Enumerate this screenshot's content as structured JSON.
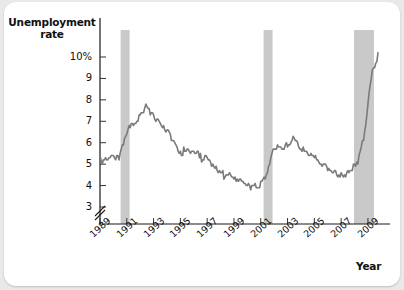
{
  "figure": {
    "y_axis_title_line1": "Unemployment",
    "y_axis_title_line2": "rate",
    "x_axis_title": "Year",
    "background_color": "#ffffff",
    "page_color": "#e9e9e9",
    "line_color": "#7a7a7a",
    "recession_band_color": "#c9c9c9",
    "axis_color": "#1a1a1a"
  },
  "chart_data": {
    "type": "line",
    "title": "",
    "subtitle": "",
    "xlabel": "Year",
    "ylabel": "Unemployment rate",
    "grid": false,
    "legend": "none",
    "y_axis_break": true,
    "ylim": [
      2.6,
      11.0
    ],
    "xlim": [
      1989.0,
      2009.9
    ],
    "ytick_labels": [
      "10%",
      "9",
      "8",
      "7",
      "6",
      "5",
      "4",
      "3"
    ],
    "yticks": [
      10,
      9,
      8,
      7,
      6,
      5,
      4,
      3
    ],
    "xtick_labels": [
      "1989",
      "1991",
      "1993",
      "1995",
      "1997",
      "1999",
      "2001",
      "2003",
      "2005",
      "2007",
      "2009"
    ],
    "xticks": [
      1989,
      1991,
      1993,
      1995,
      1997,
      1999,
      2001,
      2003,
      2005,
      2007,
      2009
    ],
    "annotations": [
      {
        "label": "recession-band-1990",
        "x_start": 1990.54,
        "x_end": 1991.21
      },
      {
        "label": "recession-band-2001",
        "x_start": 2001.21,
        "x_end": 2001.88
      },
      {
        "label": "recession-band-2007",
        "x_start": 2007.96,
        "x_end": 2009.45
      }
    ],
    "series": [
      {
        "name": "Unemployment rate",
        "color": "#7a7a7a",
        "x": [
          1989.0,
          1989.08,
          1989.17,
          1989.25,
          1989.33,
          1989.42,
          1989.5,
          1989.58,
          1989.67,
          1989.75,
          1989.83,
          1989.92,
          1990.0,
          1990.08,
          1990.17,
          1990.25,
          1990.33,
          1990.42,
          1990.5,
          1990.58,
          1990.67,
          1990.75,
          1990.83,
          1990.92,
          1991.0,
          1991.08,
          1991.17,
          1991.25,
          1991.33,
          1991.42,
          1991.5,
          1991.58,
          1991.67,
          1991.75,
          1991.83,
          1991.92,
          1992.0,
          1992.08,
          1992.17,
          1992.25,
          1992.33,
          1992.42,
          1992.5,
          1992.58,
          1992.67,
          1992.75,
          1992.83,
          1992.92,
          1993.0,
          1993.08,
          1993.17,
          1993.25,
          1993.33,
          1993.42,
          1993.5,
          1993.58,
          1993.67,
          1993.75,
          1993.83,
          1993.92,
          1994.0,
          1994.08,
          1994.17,
          1994.25,
          1994.33,
          1994.42,
          1994.5,
          1994.58,
          1994.67,
          1994.75,
          1994.83,
          1994.92,
          1995.0,
          1995.08,
          1995.17,
          1995.25,
          1995.33,
          1995.42,
          1995.5,
          1995.58,
          1995.67,
          1995.75,
          1995.83,
          1995.92,
          1996.0,
          1996.08,
          1996.17,
          1996.25,
          1996.33,
          1996.42,
          1996.5,
          1996.58,
          1996.67,
          1996.75,
          1996.83,
          1996.92,
          1997.0,
          1997.08,
          1997.17,
          1997.25,
          1997.33,
          1997.42,
          1997.5,
          1997.58,
          1997.67,
          1997.75,
          1997.83,
          1997.92,
          1998.0,
          1998.08,
          1998.17,
          1998.25,
          1998.33,
          1998.42,
          1998.5,
          1998.58,
          1998.67,
          1998.75,
          1998.83,
          1998.92,
          1999.0,
          1999.08,
          1999.17,
          1999.25,
          1999.33,
          1999.42,
          1999.5,
          1999.58,
          1999.67,
          1999.75,
          1999.83,
          1999.92,
          2000.0,
          2000.08,
          2000.17,
          2000.25,
          2000.33,
          2000.42,
          2000.5,
          2000.58,
          2000.67,
          2000.75,
          2000.83,
          2000.92,
          2001.0,
          2001.08,
          2001.17,
          2001.25,
          2001.33,
          2001.42,
          2001.5,
          2001.58,
          2001.67,
          2001.75,
          2001.83,
          2001.92,
          2002.0,
          2002.08,
          2002.17,
          2002.25,
          2002.33,
          2002.42,
          2002.5,
          2002.58,
          2002.67,
          2002.75,
          2002.83,
          2002.92,
          2003.0,
          2003.08,
          2003.17,
          2003.25,
          2003.33,
          2003.42,
          2003.5,
          2003.58,
          2003.67,
          2003.75,
          2003.83,
          2003.92,
          2004.0,
          2004.08,
          2004.17,
          2004.25,
          2004.33,
          2004.42,
          2004.5,
          2004.58,
          2004.67,
          2004.75,
          2004.83,
          2004.92,
          2005.0,
          2005.08,
          2005.17,
          2005.25,
          2005.33,
          2005.42,
          2005.5,
          2005.58,
          2005.67,
          2005.75,
          2005.83,
          2005.92,
          2006.0,
          2006.08,
          2006.17,
          2006.25,
          2006.33,
          2006.42,
          2006.5,
          2006.58,
          2006.67,
          2006.75,
          2006.83,
          2006.92,
          2007.0,
          2007.08,
          2007.17,
          2007.25,
          2007.33,
          2007.42,
          2007.5,
          2007.58,
          2007.67,
          2007.75,
          2007.83,
          2007.92,
          2008.0,
          2008.08,
          2008.17,
          2008.25,
          2008.33,
          2008.42,
          2008.5,
          2008.58,
          2008.67,
          2008.75,
          2008.83,
          2008.92,
          2009.0,
          2009.08,
          2009.17,
          2009.25,
          2009.33,
          2009.42,
          2009.5,
          2009.58,
          2009.67,
          2009.75
        ],
        "y": [
          5.4,
          5.2,
          5.0,
          5.2,
          5.2,
          5.3,
          5.2,
          5.2,
          5.3,
          5.3,
          5.4,
          5.4,
          5.4,
          5.3,
          5.2,
          5.4,
          5.4,
          5.2,
          5.5,
          5.7,
          5.9,
          5.9,
          6.2,
          6.3,
          6.4,
          6.6,
          6.8,
          6.7,
          6.9,
          6.9,
          6.8,
          6.9,
          6.9,
          7.0,
          7.0,
          7.3,
          7.3,
          7.4,
          7.4,
          7.4,
          7.6,
          7.8,
          7.7,
          7.6,
          7.6,
          7.3,
          7.4,
          7.4,
          7.3,
          7.1,
          7.0,
          7.1,
          7.1,
          7.0,
          6.9,
          6.8,
          6.7,
          6.8,
          6.6,
          6.5,
          6.6,
          6.6,
          6.5,
          6.4,
          6.1,
          6.1,
          6.1,
          6.0,
          5.9,
          5.8,
          5.6,
          5.5,
          5.6,
          5.4,
          5.4,
          5.8,
          5.6,
          5.6,
          5.7,
          5.7,
          5.6,
          5.5,
          5.6,
          5.6,
          5.6,
          5.5,
          5.5,
          5.6,
          5.6,
          5.3,
          5.5,
          5.1,
          5.2,
          5.2,
          5.4,
          5.4,
          5.3,
          5.2,
          5.2,
          5.1,
          4.9,
          5.0,
          4.9,
          4.8,
          4.9,
          4.7,
          4.6,
          4.7,
          4.6,
          4.6,
          4.7,
          4.3,
          4.4,
          4.5,
          4.5,
          4.5,
          4.6,
          4.5,
          4.4,
          4.4,
          4.3,
          4.4,
          4.2,
          4.3,
          4.2,
          4.3,
          4.3,
          4.2,
          4.2,
          4.1,
          4.1,
          4.0,
          4.0,
          4.1,
          4.0,
          3.8,
          4.0,
          4.0,
          4.0,
          4.1,
          3.9,
          3.9,
          3.9,
          3.9,
          4.2,
          4.2,
          4.3,
          4.4,
          4.3,
          4.5,
          4.6,
          4.9,
          5.0,
          5.3,
          5.5,
          5.7,
          5.7,
          5.7,
          5.7,
          5.9,
          5.8,
          5.8,
          5.8,
          5.7,
          5.7,
          5.7,
          5.9,
          6.0,
          5.8,
          5.9,
          5.9,
          6.0,
          6.1,
          6.3,
          6.2,
          6.1,
          6.1,
          6.0,
          5.8,
          5.7,
          5.7,
          5.6,
          5.8,
          5.6,
          5.6,
          5.6,
          5.5,
          5.4,
          5.4,
          5.5,
          5.4,
          5.4,
          5.3,
          5.4,
          5.2,
          5.2,
          5.1,
          5.0,
          5.0,
          4.9,
          5.0,
          5.0,
          5.0,
          4.9,
          4.7,
          4.8,
          4.7,
          4.7,
          4.6,
          4.6,
          4.7,
          4.7,
          4.5,
          4.4,
          4.5,
          4.4,
          4.6,
          4.5,
          4.4,
          4.5,
          4.4,
          4.6,
          4.7,
          4.6,
          4.7,
          4.7,
          4.7,
          5.0,
          5.0,
          4.9,
          5.1,
          5.0,
          5.4,
          5.6,
          5.8,
          6.1,
          6.1,
          6.5,
          6.8,
          7.3,
          7.8,
          8.3,
          8.7,
          9.0,
          9.4,
          9.5,
          9.5,
          9.7,
          9.8,
          10.2
        ]
      }
    ]
  }
}
